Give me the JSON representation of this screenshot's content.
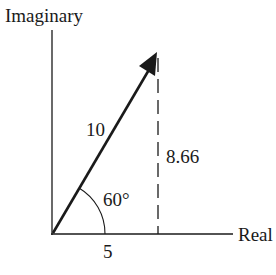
{
  "diagram": {
    "type": "complex-plane-phasor",
    "axes": {
      "vertical_label": "Imaginary",
      "horizontal_label": "Real"
    },
    "vector": {
      "magnitude_label": "10",
      "angle_label": "60°",
      "real_component_label": "5",
      "imaginary_component_label": "8.66"
    },
    "colors": {
      "ink": "#1a1a1a",
      "background": "#ffffff"
    }
  }
}
